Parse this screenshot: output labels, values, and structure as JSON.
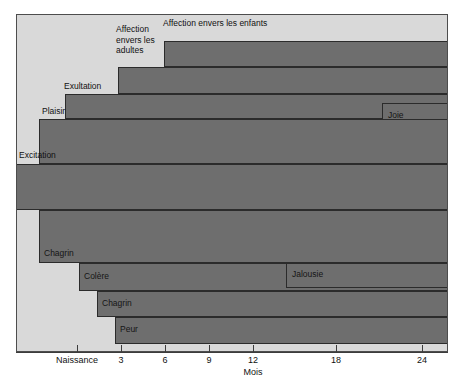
{
  "chart_data": {
    "type": "bar",
    "orientation": "horizontal",
    "title": "",
    "xlabel": "Mois",
    "ylabel": "",
    "xlim": [
      -1.8,
      26.5
    ],
    "grid": false,
    "legend": "none",
    "tick_labels": [
      "Naissance",
      "3",
      "6",
      "9",
      "12",
      "18",
      "24"
    ],
    "tick_values": [
      0,
      3,
      6,
      9,
      12,
      18,
      24
    ],
    "axis_note": "axe non lineaire apres 12 mois",
    "categories": [
      "Affection envers les enfants",
      "Affection envers les adultes",
      "Exultation",
      "Joie",
      "Plaisir",
      "Excitation",
      "Chagrin",
      "Colere",
      "Jalousie",
      "Chagrin",
      "Peur"
    ],
    "values": [
      {
        "label": "Affection envers les enfants",
        "start_month": 15,
        "end_month": 26.5,
        "label_position": "above-left"
      },
      {
        "label": "Affection envers les adultes",
        "start_month": 10.5,
        "end_month": 26.5,
        "label_position": "above-left"
      },
      {
        "label": "Exultation",
        "start_month": 5.2,
        "end_month": 26.5,
        "label_position": "above-left"
      },
      {
        "label": "Joie",
        "start_month": 20.8,
        "end_month": 26.5,
        "label_position": "inside"
      },
      {
        "label": "Plaisir",
        "start_month": 1.6,
        "end_month": 26.5,
        "label_position": "above-left"
      },
      {
        "label": "Excitation",
        "start_month": -1.8,
        "end_month": 26.5,
        "label_position": "above-left"
      },
      {
        "label": "Chagrin",
        "start_month": 1.6,
        "end_month": 26.5,
        "label_position": "inside-bottom"
      },
      {
        "label": "Colere",
        "start_month": 4.3,
        "end_month": 26.5,
        "label_position": "inside"
      },
      {
        "label": "Jalousie",
        "start_month": 17.5,
        "end_month": 26.5,
        "label_position": "inside"
      },
      {
        "label": "Chagrin",
        "start_month": 5.5,
        "end_month": 26.5,
        "label_position": "inside"
      },
      {
        "label": "Peur",
        "start_month": 6.7,
        "end_month": 26.5,
        "label_position": "inside"
      }
    ]
  },
  "chart": {
    "axis_title": "Mois",
    "ticks": [
      {
        "label": "Naissance",
        "x": 77
      },
      {
        "label": "3",
        "x": 121
      },
      {
        "label": "6",
        "x": 165
      },
      {
        "label": "9",
        "x": 209
      },
      {
        "label": "12",
        "x": 253
      },
      {
        "label": "18",
        "x": 336
      },
      {
        "label": "24",
        "x": 422
      }
    ],
    "bars": [
      {
        "name": "affection-enfants",
        "label": "Affection envers les enfants",
        "left": 147,
        "top": 26,
        "height": 26,
        "placement": "out",
        "lx": 146,
        "ly": 3,
        "lw": 200
      },
      {
        "name": "affection-adultes",
        "label": "Affection\nenvers les\nadultes",
        "left": 101,
        "top": 52,
        "height": 27,
        "placement": "out",
        "lx": 99,
        "ly": 9,
        "lw": 60
      },
      {
        "name": "exultation",
        "label": "Exultation",
        "left": 48,
        "top": 79,
        "height": 25,
        "placement": "out",
        "lx": 47,
        "ly": 66,
        "lw": 70
      },
      {
        "name": "joie",
        "label": "Joie",
        "left": 365,
        "top": 88,
        "height": 25,
        "placement": "in",
        "lx": 371,
        "ly": 95,
        "lw": 60
      },
      {
        "name": "plaisir",
        "label": "Plaisir",
        "left": 22,
        "top": 104,
        "height": 45,
        "placement": "out",
        "lx": 25,
        "ly": 91,
        "lw": 60
      },
      {
        "name": "excitation",
        "label": "Excitation",
        "left": -2,
        "top": 149,
        "height": 46,
        "placement": "out",
        "lx": 2,
        "ly": 135,
        "lw": 70
      },
      {
        "name": "chagrin-1",
        "label": "Chagrin",
        "left": 22,
        "top": 195,
        "height": 53,
        "placement": "in",
        "lx": 27,
        "ly": 233,
        "lw": 60
      },
      {
        "name": "colere",
        "label": "Colère",
        "left": 62,
        "top": 248,
        "height": 28,
        "placement": "in",
        "lx": 67,
        "ly": 256,
        "lw": 60
      },
      {
        "name": "jalousie",
        "label": "Jalousie",
        "left": 269,
        "top": 248,
        "height": 25,
        "placement": "in",
        "lx": 275,
        "ly": 254,
        "lw": 60
      },
      {
        "name": "chagrin-2",
        "label": "Chagrin",
        "left": 80,
        "top": 276,
        "height": 26,
        "placement": "in",
        "lx": 85,
        "ly": 283,
        "lw": 60
      },
      {
        "name": "peur",
        "label": "Peur",
        "left": 98,
        "top": 302,
        "height": 27,
        "placement": "in",
        "lx": 103,
        "ly": 309,
        "lw": 60
      }
    ]
  }
}
